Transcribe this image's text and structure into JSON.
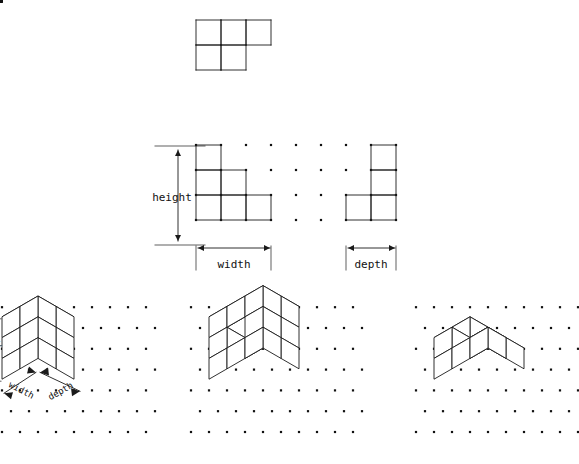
{
  "figure": {
    "background": "#ffffff",
    "ink": "#1a1a1a",
    "dot_color": "#111111",
    "line_width": 0.9
  },
  "labels": {
    "height": "height",
    "width": "width",
    "depth": "depth",
    "iso_height": "height",
    "iso_width": "width",
    "iso_depth": "depth"
  },
  "ortho": {
    "grid": {
      "spacing": 25,
      "top_view": {
        "origin_x": 196,
        "origin_y": 20,
        "cols": 9,
        "rows": 5
      },
      "front_view": {
        "origin_x": 196,
        "origin_y": 145,
        "cols": 4,
        "rows": 4
      },
      "side_view": {
        "origin_x": 346,
        "origin_y": 145,
        "cols": 4,
        "rows": 4
      }
    },
    "top_view": {
      "name": "top-view",
      "cells": [
        [
          0,
          0
        ],
        [
          1,
          0
        ],
        [
          2,
          0
        ],
        [
          0,
          1
        ],
        [
          1,
          1
        ]
      ],
      "cell_size": 25
    },
    "front_view": {
      "name": "front-view",
      "cells": [
        [
          0,
          0
        ],
        [
          0,
          1
        ],
        [
          1,
          1
        ],
        [
          0,
          2
        ],
        [
          1,
          2
        ],
        [
          2,
          2
        ]
      ],
      "cell_size": 25
    },
    "side_view": {
      "name": "side-view",
      "cells": [
        [
          1,
          0
        ],
        [
          1,
          1
        ],
        [
          0,
          2
        ],
        [
          1,
          2
        ]
      ],
      "cell_size": 25
    },
    "dimensions": {
      "height": {
        "from_y": 157,
        "to_y": 246,
        "x": 178
      },
      "width": {
        "from_x": 197,
        "to_x": 272,
        "y": 256
      },
      "depth": {
        "from_x": 347,
        "to_x": 397,
        "y": 256
      }
    }
  },
  "iso": {
    "dot_dx": 18,
    "dot_dy": 10.4,
    "figures": [
      {
        "name": "iso-single-box",
        "caption_labels": [
          "height",
          "width",
          "depth"
        ],
        "origin": {
          "x": 38,
          "y": 400
        },
        "cubes": [
          [
            0,
            0,
            0
          ],
          [
            1,
            0,
            0
          ],
          [
            0,
            1,
            0
          ],
          [
            1,
            1,
            0
          ],
          [
            0,
            0,
            1
          ],
          [
            1,
            0,
            1
          ],
          [
            0,
            1,
            1
          ],
          [
            1,
            1,
            1
          ],
          [
            0,
            0,
            2
          ],
          [
            1,
            0,
            2
          ],
          [
            0,
            1,
            2
          ],
          [
            1,
            1,
            2
          ]
        ],
        "dims": {
          "w": 2,
          "d": 2,
          "h": 3
        }
      },
      {
        "name": "iso-notched-solid",
        "origin": {
          "x": 245,
          "y": 400
        },
        "cubes": [
          [
            0,
            0,
            0
          ],
          [
            1,
            0,
            0
          ],
          [
            2,
            0,
            0
          ],
          [
            0,
            1,
            0
          ],
          [
            1,
            1,
            0
          ],
          [
            2,
            1,
            0
          ],
          [
            0,
            0,
            1
          ],
          [
            1,
            0,
            1
          ],
          [
            2,
            0,
            1
          ],
          [
            0,
            1,
            1
          ],
          [
            2,
            1,
            1
          ],
          [
            0,
            0,
            2
          ],
          [
            1,
            0,
            2
          ],
          [
            2,
            0,
            2
          ],
          [
            0,
            1,
            2
          ],
          [
            1,
            1,
            2
          ],
          [
            2,
            1,
            2
          ]
        ],
        "dims": {
          "w": 3,
          "d": 2,
          "h": 3
        }
      },
      {
        "name": "iso-staircase-solid",
        "origin": {
          "x": 470,
          "y": 400
        },
        "cubes": [
          [
            0,
            0,
            0
          ],
          [
            1,
            0,
            0
          ],
          [
            2,
            0,
            0
          ],
          [
            0,
            1,
            0
          ],
          [
            1,
            1,
            0
          ],
          [
            2,
            1,
            0
          ],
          [
            0,
            0,
            1
          ],
          [
            1,
            0,
            1
          ],
          [
            0,
            1,
            1
          ],
          [
            0,
            0,
            2
          ]
        ],
        "dims": {
          "w": 3,
          "d": 2,
          "h": 3
        }
      }
    ]
  }
}
